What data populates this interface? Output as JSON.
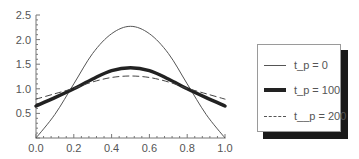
{
  "chart_data": {
    "type": "line",
    "title": "",
    "xlabel": "",
    "ylabel": "",
    "xlim": [
      0.0,
      1.0
    ],
    "ylim": [
      0.0,
      2.5
    ],
    "grid": false,
    "legend_position": "right, outside plot, with drop shadow",
    "x_ticks": [
      "0.0",
      "0.2",
      "0.4",
      "0.6",
      "0.8",
      "1.0"
    ],
    "y_ticks": [
      "0.5",
      "1.0",
      "1.5",
      "2.0",
      "2.5"
    ],
    "x": [
      0.0,
      0.1,
      0.2,
      0.3,
      0.4,
      0.5,
      0.6,
      0.7,
      0.8,
      0.9,
      1.0
    ],
    "series": [
      {
        "name": "t_p = 0",
        "style": "thin solid",
        "values": [
          0.0,
          0.48,
          1.1,
          1.72,
          2.12,
          2.27,
          2.12,
          1.72,
          1.1,
          0.48,
          0.0
        ]
      },
      {
        "name": "t_p = 100",
        "style": "thick solid",
        "values": [
          0.65,
          0.82,
          1.0,
          1.2,
          1.37,
          1.43,
          1.37,
          1.2,
          1.0,
          0.82,
          0.65
        ]
      },
      {
        "name": "t__p = 200",
        "style": "dashed",
        "values": [
          0.79,
          0.9,
          1.01,
          1.14,
          1.23,
          1.26,
          1.23,
          1.14,
          1.01,
          0.9,
          0.79
        ]
      }
    ]
  },
  "legend": {
    "items": [
      {
        "label": "t_p = 0"
      },
      {
        "label": "t_p = 100"
      },
      {
        "label": "t__p = 200"
      }
    ]
  }
}
